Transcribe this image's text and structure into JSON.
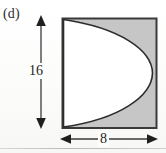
{
  "figure": {
    "part_label": "(d)",
    "description_type": "geometry-diagram",
    "shape": {
      "outer": "rectangle",
      "inner": "semi-ellipse",
      "inner_fill": "white",
      "shaded_region": "rectangle-minus-semi-ellipse",
      "semi_ellipse_flat_side": "left"
    },
    "dimensions": {
      "height_label": "16",
      "width_label": "8"
    },
    "colors": {
      "shaded_fill": "#c6c6c6",
      "outline": "#2f2f2f",
      "inner_fill": "#ffffff",
      "paper": "#fdfdfc",
      "text": "#242424"
    },
    "geometry_px": {
      "rect_left": 62,
      "rect_top": 18,
      "rect_right": 157,
      "rect_bottom": 128,
      "v_arrow_x": 41,
      "v_arrow_top": 16,
      "v_arrow_bottom": 128,
      "h_arrow_y": 139,
      "h_arrow_left": 61,
      "h_arrow_right": 157
    }
  }
}
